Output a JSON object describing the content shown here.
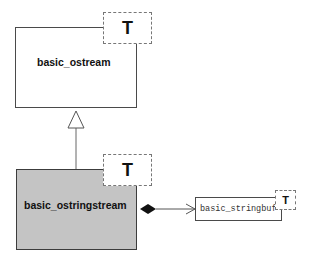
{
  "diagram": {
    "type": "UML class diagram",
    "classes": [
      {
        "id": "basic_ostream",
        "name": "basic_ostream",
        "template_param": "T",
        "highlighted": false
      },
      {
        "id": "basic_ostringstream",
        "name": "basic_ostringstream",
        "template_param": "T",
        "highlighted": true
      },
      {
        "id": "basic_stringbuf",
        "name": "basic_stringbuf",
        "template_param": "T",
        "highlighted": false
      }
    ],
    "relations": [
      {
        "type": "inheritance",
        "from": "basic_ostringstream",
        "to": "basic_ostream"
      },
      {
        "type": "composition",
        "from": "basic_ostringstream",
        "to": "basic_stringbuf"
      }
    ],
    "colors": {
      "highlight_fill": "#c4c4c4",
      "border": "#4a4a4a",
      "dashed_border": "#777777",
      "line": "#555555"
    }
  }
}
